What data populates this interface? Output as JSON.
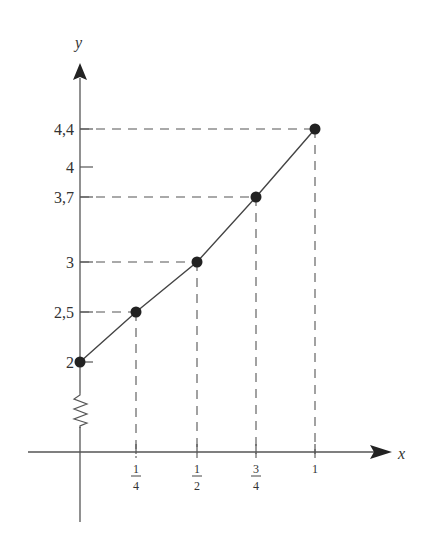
{
  "chart_data": {
    "type": "line",
    "title": "",
    "xlabel": "x",
    "ylabel": "y",
    "x": [
      0,
      0.25,
      0.5,
      0.75,
      1
    ],
    "values": [
      2,
      2.5,
      3,
      3.7,
      4.4
    ],
    "x_tick_labels": [
      {
        "num": "1",
        "den": "4"
      },
      {
        "num": "1",
        "den": "2"
      },
      {
        "num": "3",
        "den": "4"
      },
      {
        "num": "1",
        "den": ""
      }
    ],
    "y_tick_labels": [
      "2",
      "2,5",
      "3",
      "3,7",
      "4",
      "4,4"
    ],
    "annotations": [
      "dashed guide lines from each point to both axes",
      "zigzag axis break on y-axis below 2"
    ],
    "xlim": [
      0,
      1.1
    ],
    "ylim": [
      0,
      4.6
    ],
    "grid": false,
    "legend": "none"
  }
}
